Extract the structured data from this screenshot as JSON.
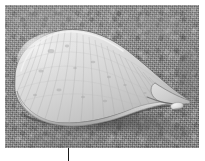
{
  "figure": {
    "kind": "photograph",
    "caption": "",
    "frame": {
      "left": 5,
      "top": 5,
      "width": 194,
      "height": 143,
      "background_color": "#8b8b8b"
    }
  },
  "scene": {
    "background": {
      "name": "sand",
      "label": "sand",
      "color": "#8b8b8b",
      "highlight_color": "#969696",
      "shadow_color": "#7f7f7f"
    },
    "objects": [
      {
        "name": "shell",
        "label": "conch shell",
        "body_color": "#d9d9d9",
        "highlight_color": "#ededed",
        "shadow_color": "#a9a9a9",
        "outline_color": "#6e6e6e",
        "orientation": "apex-left, siphonal-canal-right"
      },
      {
        "name": "pebble",
        "label": "small white pebble",
        "color": "#e4e4e4"
      },
      {
        "name": "cast-shadow",
        "label": "cast shadow beneath shell",
        "color": "#4a4a4a"
      }
    ]
  },
  "annotations": {
    "leader_line": {
      "name": "leader-line",
      "label": "leader line",
      "color": "#1b1b1b",
      "x": 68,
      "y_start": 148,
      "y_end": 161
    }
  },
  "page": {
    "background_color": "#ffffff",
    "width": 205,
    "height": 161
  }
}
